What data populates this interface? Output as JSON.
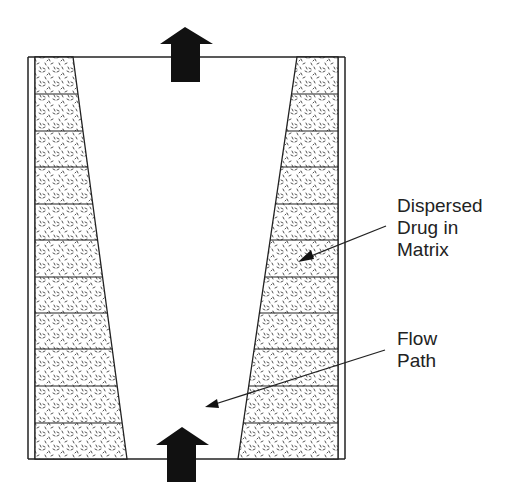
{
  "diagram": {
    "labels": {
      "matrix": [
        "Dispersed",
        "Drug in",
        "Matrix"
      ],
      "flow": [
        "Flow",
        "Path"
      ]
    },
    "colors": {
      "stroke": "#222222",
      "fill_arrow": "#111111",
      "matrix_fill": "#ffffff",
      "speckle": "#555555"
    },
    "segments": 11
  }
}
